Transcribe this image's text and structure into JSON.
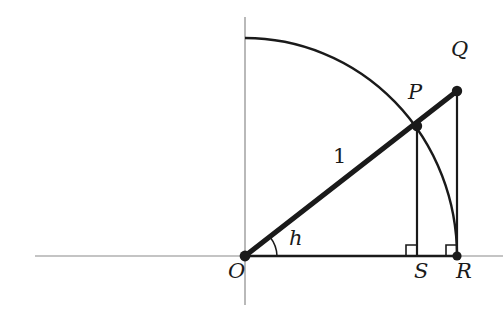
{
  "figure": {
    "background_color": "#ffffff",
    "ink_color": "#1a1a1a",
    "axis_color": "#8a8a8a",
    "width": 503,
    "height": 329
  },
  "labels": {
    "origin": "O",
    "point_p": "P",
    "point_q": "Q",
    "point_r": "R",
    "point_s": "S",
    "radius_length": "1",
    "angle": "h"
  },
  "geometry": {
    "origin": {
      "x": 245,
      "y": 256
    },
    "point_p": {
      "x": 417,
      "y": 126
    },
    "point_q": {
      "x": 457,
      "y": 91
    },
    "point_r": {
      "x": 457,
      "y": 256
    },
    "point_s": {
      "x": 417,
      "y": 256
    },
    "arc_top": {
      "x": 245,
      "y": 38
    },
    "radius": 212,
    "angle_degrees": 37
  },
  "label_positions": {
    "origin": {
      "x": 228,
      "y": 262
    },
    "point_p": {
      "x": 409,
      "y": 83
    },
    "point_q": {
      "x": 452,
      "y": 40
    },
    "point_r": {
      "x": 459,
      "y": 262
    },
    "point_s": {
      "x": 415,
      "y": 262
    },
    "radius_length": "{ \"x\": 333, \"y\": 147 }",
    "angle": {
      "x": 289,
      "y": 229
    }
  },
  "elements": {
    "x_axis": {
      "x1": 35,
      "y1": 256,
      "x2": 503,
      "y2": 256
    },
    "y_axis": {
      "x1": 245,
      "y1": 17,
      "x2": 245,
      "y2": 305
    },
    "segment_oq": {
      "label": "hypotenuse O to Q",
      "stroke_width": 5
    },
    "segment_or": {
      "label": "base O to R",
      "stroke_width": 2.4
    },
    "segment_ps": {
      "label": "perpendicular P to S",
      "stroke_width": 2.2
    },
    "segment_qr": {
      "label": "perpendicular Q to R",
      "stroke_width": 2.2
    },
    "arc_pr": {
      "label": "circular arc from y-axis through P to R",
      "stroke_width": 2.4
    },
    "angle_arc": {
      "label": "angle marker at O",
      "radius": 30
    },
    "right_angle_s": {
      "label": "right angle mark at S",
      "size": 11
    },
    "right_angle_r": {
      "label": "right angle mark at R",
      "size": 11
    }
  }
}
